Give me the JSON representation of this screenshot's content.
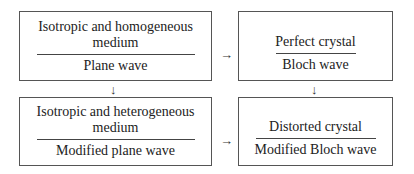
{
  "diagram": {
    "boxes": [
      {
        "id": "top-left",
        "top": "Isotropic and homogeneous medium",
        "bottom": "Plane wave"
      },
      {
        "id": "top-right",
        "top": "Perfect crystal",
        "bottom": "Bloch wave"
      },
      {
        "id": "bottom-left",
        "top": "Isotropic and heterogeneous medium",
        "bottom": "Modified plane wave"
      },
      {
        "id": "bottom-right",
        "top": "Distorted crystal",
        "bottom": "Modified Bloch wave"
      }
    ],
    "arrows": {
      "right_arrow": "→",
      "down_arrow": "↓"
    }
  }
}
